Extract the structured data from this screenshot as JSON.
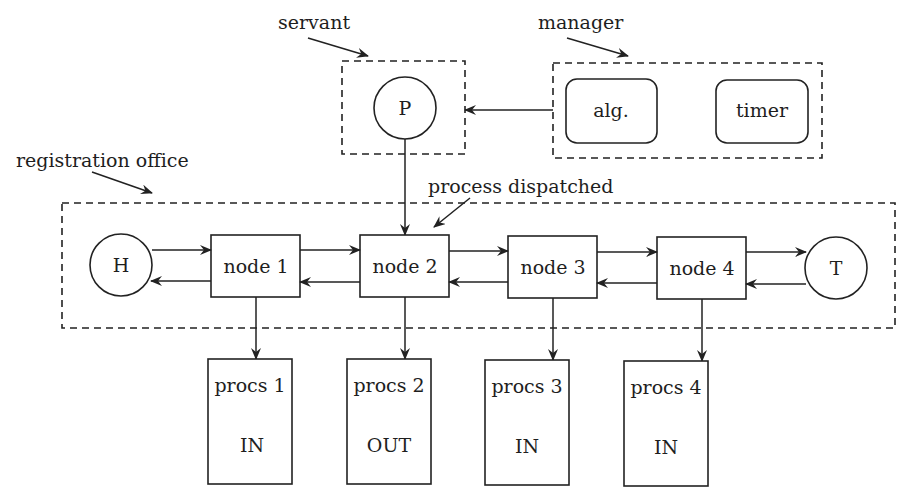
{
  "diagram": {
    "groups": {
      "servant": {
        "label": "servant"
      },
      "manager": {
        "label": "manager"
      },
      "registration_office": {
        "label": "registration office"
      }
    },
    "annotations": {
      "process_dispatched": "process dispatched"
    },
    "servant_process": {
      "label": "P"
    },
    "manager_components": [
      {
        "label": "alg."
      },
      {
        "label": "timer"
      }
    ],
    "chain": {
      "head": {
        "label": "H"
      },
      "tail": {
        "label": "T"
      },
      "nodes": [
        {
          "label": "node 1"
        },
        {
          "label": "node 2"
        },
        {
          "label": "node 3"
        },
        {
          "label": "node 4"
        }
      ]
    },
    "procs": [
      {
        "label": "procs 1",
        "state": "IN"
      },
      {
        "label": "procs 2",
        "state": "OUT"
      },
      {
        "label": "procs 3",
        "state": "IN"
      },
      {
        "label": "procs 4",
        "state": "IN"
      }
    ],
    "colors": {
      "stroke": "#222222",
      "background": "#ffffff"
    }
  }
}
